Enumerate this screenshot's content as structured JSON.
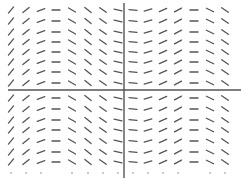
{
  "chart_data": {
    "type": "slope-field",
    "title": "",
    "xlabel": "",
    "ylabel": "",
    "grid": false,
    "legend": null,
    "axes": {
      "x_axis": {
        "y_px": 90,
        "x_from_px": 8,
        "x_to_px": 241
      },
      "y_axis": {
        "x_px": 124,
        "y_from_px": 3,
        "y_to_px": 178
      },
      "color": "#555555"
    },
    "segment_color": "#555555",
    "segment_half_length_px": 4,
    "columns_px": [
      11,
      26,
      41,
      56,
      72,
      88,
      103,
      118,
      133,
      148,
      163,
      178,
      194,
      210,
      225
    ],
    "rows_px": [
      10,
      21,
      32,
      42,
      52,
      62,
      72,
      83,
      98,
      109,
      120,
      130,
      141,
      152,
      162
    ],
    "dot_row_px": 173,
    "dot_columns_px": [
      11,
      26,
      41,
      72,
      88,
      103,
      118,
      133,
      148,
      163,
      178,
      210,
      225
    ],
    "column_slopes": [
      1.2,
      0.8,
      0.35,
      0.0,
      -0.6,
      -0.8,
      -0.7,
      -0.2,
      -0.1,
      0.3,
      0.45,
      0.55,
      0.0,
      -0.5,
      -0.7
    ]
  }
}
